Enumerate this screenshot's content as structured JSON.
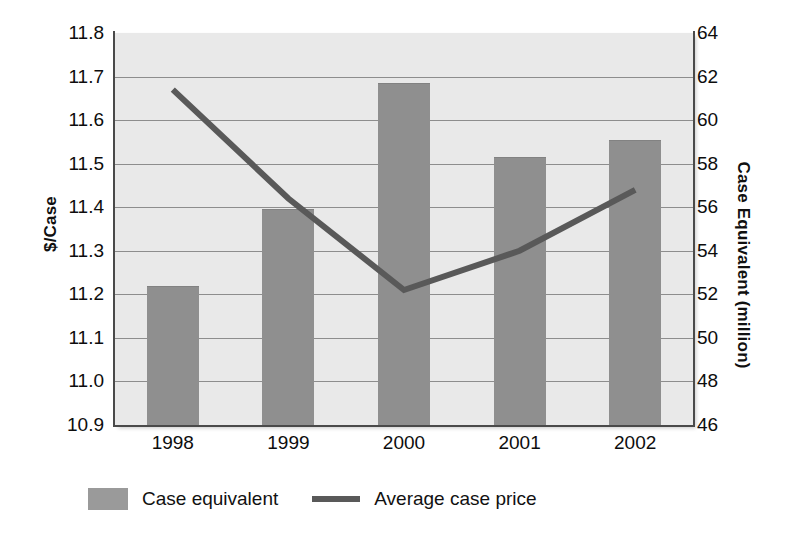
{
  "chart_data": {
    "type": "bar",
    "title": "",
    "categories": [
      "1998",
      "1999",
      "2000",
      "2001",
      "2002"
    ],
    "xlabel": "",
    "grid": true,
    "legend_position": "bottom",
    "axes": {
      "left": {
        "label": "$/Case",
        "min": 10.9,
        "max": 11.8,
        "step": 0.1,
        "ticks": [
          "11.8",
          "11.7",
          "11.6",
          "11.5",
          "11.4",
          "11.3",
          "11.2",
          "11.1",
          "11.0",
          "10.9"
        ]
      },
      "right": {
        "label": "Case Equivalent (million)",
        "min": 46,
        "max": 64,
        "step": 2,
        "ticks": [
          "64",
          "62",
          "60",
          "58",
          "56",
          "54",
          "52",
          "50",
          "48",
          "46"
        ]
      }
    },
    "series": [
      {
        "name": "Case equivalent",
        "type": "bar",
        "axis": "right",
        "unit": "million",
        "color": "#8f8f8f",
        "values": [
          52.4,
          55.9,
          61.7,
          58.3,
          59.1
        ]
      },
      {
        "name": "Average case price",
        "type": "line",
        "axis": "left",
        "unit": "$/Case",
        "color": "#595959",
        "values": [
          11.67,
          11.42,
          11.21,
          11.3,
          11.44
        ]
      }
    ]
  },
  "legend": {
    "items": [
      {
        "label": "Case equivalent",
        "marker": "bar-swatch"
      },
      {
        "label": "Average case price",
        "marker": "line-swatch"
      }
    ]
  }
}
